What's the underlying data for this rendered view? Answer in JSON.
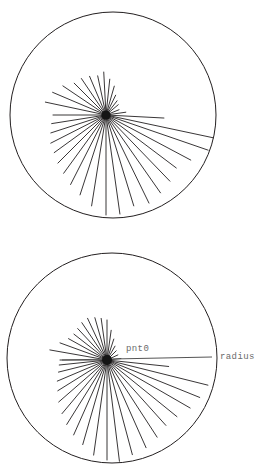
{
  "document": {
    "type": "geometry-diagram",
    "background_color": "#ffffff",
    "width": 267,
    "height": 476
  },
  "style": {
    "circle_stroke": "#231f20",
    "circle_stroke_width": 1.0,
    "ray_stroke": "#231f20",
    "ray_stroke_width": 0.9,
    "radius_line_stroke": "#555555",
    "radius_line_width": 1.2,
    "hub_fill": "#151515",
    "label_color": "#6b6b6b",
    "label_font_size": 9
  },
  "figures": [
    {
      "id": "figure-top",
      "name": "circle-with-radiating-rays-unlabeled",
      "circle": {
        "cx": 113,
        "cy": 115,
        "r": 103
      },
      "hub": {
        "cx": 106,
        "cy": 115,
        "r": 4.6
      },
      "labels": [],
      "rays": [
        {
          "angle_deg": 180,
          "length": 53
        },
        {
          "angle_deg": 168,
          "length": 62
        },
        {
          "angle_deg": 157,
          "length": 58
        },
        {
          "angle_deg": 146,
          "length": 52
        },
        {
          "angle_deg": 135,
          "length": 45
        },
        {
          "angle_deg": 124,
          "length": 44
        },
        {
          "angle_deg": 113,
          "length": 42
        },
        {
          "angle_deg": 102,
          "length": 40
        },
        {
          "angle_deg": 93,
          "length": 43
        },
        {
          "angle_deg": 84,
          "length": 36
        },
        {
          "angle_deg": 74,
          "length": 30
        },
        {
          "angle_deg": 64,
          "length": 22
        },
        {
          "angle_deg": 52,
          "length": 18
        },
        {
          "angle_deg": 40,
          "length": 16
        },
        {
          "angle_deg": 22,
          "length": 14
        },
        {
          "angle_deg": 8,
          "length": 20
        },
        {
          "angle_deg": -3,
          "length": 58
        },
        {
          "angle_deg": -12,
          "length": 110
        },
        {
          "angle_deg": -19,
          "length": 108
        },
        {
          "angle_deg": -28,
          "length": 96
        },
        {
          "angle_deg": -37,
          "length": 88
        },
        {
          "angle_deg": -46,
          "length": 92
        },
        {
          "angle_deg": -55,
          "length": 95
        },
        {
          "angle_deg": -64,
          "length": 98
        },
        {
          "angle_deg": -73,
          "length": 95
        },
        {
          "angle_deg": -82,
          "length": 100
        },
        {
          "angle_deg": -90,
          "length": 100
        },
        {
          "angle_deg": -99,
          "length": 92
        },
        {
          "angle_deg": -108,
          "length": 84
        },
        {
          "angle_deg": -117,
          "length": 78
        },
        {
          "angle_deg": -126,
          "length": 72
        },
        {
          "angle_deg": -135,
          "length": 68
        },
        {
          "angle_deg": -144,
          "length": 64
        },
        {
          "angle_deg": -153,
          "length": 62
        },
        {
          "angle_deg": -162,
          "length": 58
        },
        {
          "angle_deg": -171,
          "length": 55
        }
      ]
    },
    {
      "id": "figure-bottom",
      "name": "circle-with-radiating-rays-labeled",
      "circle": {
        "cx": 112,
        "cy": 358,
        "r": 105
      },
      "hub": {
        "cx": 107,
        "cy": 360,
        "r": 5.0
      },
      "radius_line": {
        "x1": 62,
        "y1": 360,
        "x2": 212,
        "y2": 357
      },
      "labels": [
        {
          "name": "pnt0",
          "text": "pnt0",
          "x": 126,
          "y": 349
        },
        {
          "name": "radius",
          "text": "radius",
          "x": 220,
          "y": 357
        }
      ],
      "rays": [
        {
          "angle_deg": 180,
          "length": 47
        },
        {
          "angle_deg": 170,
          "length": 58
        },
        {
          "angle_deg": 160,
          "length": 50
        },
        {
          "angle_deg": 151,
          "length": 44
        },
        {
          "angle_deg": 142,
          "length": 42
        },
        {
          "angle_deg": 133,
          "length": 43
        },
        {
          "angle_deg": 124,
          "length": 45
        },
        {
          "angle_deg": 115,
          "length": 46
        },
        {
          "angle_deg": 106,
          "length": 44
        },
        {
          "angle_deg": 98,
          "length": 42
        },
        {
          "angle_deg": 90,
          "length": 40
        },
        {
          "angle_deg": 82,
          "length": 30
        },
        {
          "angle_deg": 72,
          "length": 22
        },
        {
          "angle_deg": 60,
          "length": 16
        },
        {
          "angle_deg": 45,
          "length": 13
        },
        {
          "angle_deg": 25,
          "length": 12
        },
        {
          "angle_deg": 6,
          "length": 14
        },
        {
          "angle_deg": -6,
          "length": 62
        },
        {
          "angle_deg": -14,
          "length": 104
        },
        {
          "angle_deg": -22,
          "length": 100
        },
        {
          "angle_deg": -30,
          "length": 96
        },
        {
          "angle_deg": -39,
          "length": 90
        },
        {
          "angle_deg": -48,
          "length": 88
        },
        {
          "angle_deg": -57,
          "length": 92
        },
        {
          "angle_deg": -66,
          "length": 96
        },
        {
          "angle_deg": -75,
          "length": 98
        },
        {
          "angle_deg": -83,
          "length": 102
        },
        {
          "angle_deg": -90,
          "length": 100
        },
        {
          "angle_deg": -98,
          "length": 96
        },
        {
          "angle_deg": -106,
          "length": 88
        },
        {
          "angle_deg": -114,
          "length": 82
        },
        {
          "angle_deg": -122,
          "length": 76
        },
        {
          "angle_deg": -130,
          "length": 70
        },
        {
          "angle_deg": -139,
          "length": 64
        },
        {
          "angle_deg": -148,
          "length": 58
        },
        {
          "angle_deg": -157,
          "length": 54
        },
        {
          "angle_deg": -166,
          "length": 50
        },
        {
          "angle_deg": -174,
          "length": 48
        }
      ]
    }
  ]
}
